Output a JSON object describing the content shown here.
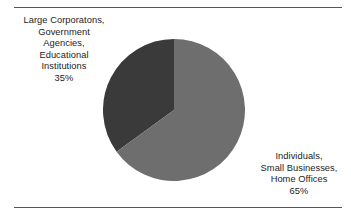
{
  "figure": {
    "background_color": "#ffffff",
    "rule_color": "#555555",
    "text_color": "#1c1c1c"
  },
  "rules": {
    "top_label": "top-divider-rule",
    "bottom_label": "bottom-divider-rule"
  },
  "labels": {
    "left": {
      "lines": [
        "Large Corporatons,",
        "Government",
        "Agencies,",
        "Educational",
        "Institutions",
        "35%"
      ]
    },
    "right": {
      "lines": [
        "Individuals,",
        "Small Businesses,",
        "Home Offices",
        "65%"
      ]
    }
  },
  "chart_data": {
    "type": "pie",
    "title": "",
    "subtitle": "",
    "xlabel": "",
    "ylabel": "",
    "legend_position": "none",
    "grid": false,
    "start_angle_deg": 90,
    "direction": "counterclockwise",
    "center_px": [
      174,
      110
    ],
    "radius_px": 71,
    "labels": [
      "Large Corporatons, Government Agencies, Educational Institutions",
      "Individuals, Small Businesses, Home Offices"
    ],
    "values": [
      35,
      65
    ],
    "value_suffix": "%",
    "colors": [
      "#3a3a3a",
      "#6e6e6e"
    ],
    "slices": [
      {
        "name": "Large Corporatons, Government Agencies, Educational Institutions",
        "value": 35,
        "display": "35%",
        "color": "#3a3a3a",
        "label_side": "left"
      },
      {
        "name": "Individuals, Small Businesses, Home Offices",
        "value": 65,
        "display": "65%",
        "color": "#6e6e6e",
        "label_side": "right"
      }
    ]
  }
}
